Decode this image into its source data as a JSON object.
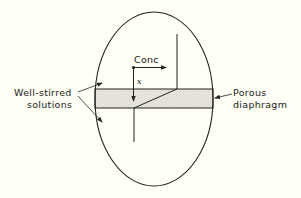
{
  "diagram": {
    "labels": {
      "conc": "Conc",
      "x_axis": "x",
      "well_stirred_line1": "Well-stirred",
      "well_stirred_line2": "solutions",
      "porous_line1": "Porous",
      "porous_line2": "diaphragm"
    },
    "colors": {
      "background": "#fffff5",
      "ink": "#222222",
      "diaphragm_fill": "#e6e4da"
    }
  }
}
